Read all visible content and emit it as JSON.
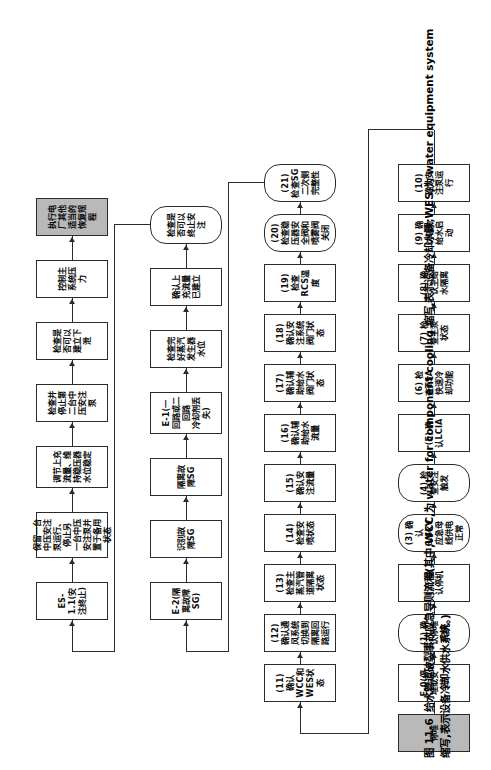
{
  "figure": {
    "number": "图 11-6",
    "caption": "给水管道破裂事故应急导则流程(其中,WCC,为 water for component cooling 缩写,表示设备冷却水源;WES,为 water equipment system 缩写,表示设备冷却水供水系统。)"
  },
  "colors": {
    "shaded_fill": "#b9b9b9",
    "node_border": "#2b2b2b",
    "page_background": "#ffffff"
  },
  "flow": {
    "row1": [
      {
        "id": "start",
        "label": "停堆",
        "shape": "rect",
        "shaded": true
      },
      {
        "id": "e0",
        "label": "E-0(停堆或安注)",
        "shape": "rect",
        "shaded": false
      },
      {
        "id": "s1",
        "label": "(1) 确认停堆完成",
        "shape": "rounded",
        "shaded": false
      },
      {
        "id": "s2",
        "label": "(2) 确认停机",
        "shape": "rect",
        "shaded": false
      },
      {
        "id": "s3",
        "label": "(3) 确认6.6kV应急母线供电正常",
        "shape": "rounded",
        "shaded": false
      },
      {
        "id": "s4",
        "label": "(4) 检查安注触发",
        "shape": "rounded",
        "shaded": false
      },
      {
        "id": "s5",
        "label": "(5) 确认LCIA",
        "shape": "rect",
        "shaded": false
      },
      {
        "id": "s6",
        "label": "(6) 检查TSA快速冷却功能",
        "shape": "rect",
        "shaded": false
      },
      {
        "id": "s7",
        "label": "(7) 检查主泵状态",
        "shape": "rect",
        "shaded": false
      },
      {
        "id": "s8",
        "label": "(8) 确认主给水隔离",
        "shape": "rect",
        "shaded": false
      },
      {
        "id": "s9",
        "label": "(9) 确认辅助给水启动",
        "shape": "rect",
        "shaded": false
      },
      {
        "id": "s10",
        "label": "(10) 确认安注泵运行",
        "shape": "rect",
        "shaded": false
      }
    ],
    "row2": [
      {
        "id": "s11",
        "label": "(11) 确认WCC和WES状态",
        "shape": "rect",
        "shaded": false
      },
      {
        "id": "s12",
        "label": "(12) 确认通风系统切换到隔离回路运行",
        "shape": "rect",
        "shaded": false
      },
      {
        "id": "s13",
        "label": "(13) 检查主蒸汽管道隔离状态",
        "shape": "rect",
        "shaded": false
      },
      {
        "id": "s14",
        "label": "(14) 检查安喷状态",
        "shape": "rect",
        "shaded": false
      },
      {
        "id": "s15",
        "label": "(15) 确认安注流量",
        "shape": "rect",
        "shaded": false
      },
      {
        "id": "s16",
        "label": "(16) 确认辅助给水流量",
        "shape": "rect",
        "shaded": false
      },
      {
        "id": "s17",
        "label": "(17) 确认辅助给水阀门状态",
        "shape": "rect",
        "shaded": false
      },
      {
        "id": "s18",
        "label": "(18) 确认安注系统阀门状态",
        "shape": "rect",
        "shaded": false
      },
      {
        "id": "s19",
        "label": "(19) 检查RCS温度",
        "shape": "rect",
        "shaded": false
      },
      {
        "id": "s20",
        "label": "(20) 检查稳压器安全阀和喷雾阀关闭",
        "shape": "rounded",
        "shaded": false
      },
      {
        "id": "s21",
        "label": "(21) 检查SG二次侧完整性",
        "shape": "rounded",
        "shaded": false
      }
    ],
    "row3": [
      {
        "id": "e2",
        "label": "E-2(隔离故障SG)",
        "shape": "rect",
        "shaded": false
      },
      {
        "id": "r3b",
        "label": "识别故障SG",
        "shape": "rect",
        "shaded": false
      },
      {
        "id": "r3c",
        "label": "隔离故障SG",
        "shape": "rect",
        "shaded": false
      },
      {
        "id": "e1",
        "label": "E-1(一回路或二回路\n冷却剂丢失)",
        "shape": "rect",
        "shaded": false
      },
      {
        "id": "r3e",
        "label": "检查完好蒸汽发生器水位",
        "shape": "rect",
        "shaded": false
      },
      {
        "id": "r3f",
        "label": "确认上充流量已建立",
        "shape": "rect",
        "shaded": false
      },
      {
        "id": "r3g",
        "label": "检查是否可以终止安注",
        "shape": "rounded",
        "shaded": false
      }
    ],
    "row4": [
      {
        "id": "es11",
        "label": "ES-1.1(安注终止)",
        "shape": "rect",
        "shaded": false
      },
      {
        "id": "r4b",
        "label": "保留一台中压安注泵运行、停止另\n一台中压安注泵并置于备用状态",
        "shape": "rect",
        "shaded": false
      },
      {
        "id": "r4c",
        "label": "调节上充流量、维持稳压器\n水位稳定",
        "shape": "rect",
        "shaded": false
      },
      {
        "id": "r4d",
        "label": "检查并停止第二台中压安注泵",
        "shape": "rect",
        "shaded": false
      },
      {
        "id": "r4e",
        "label": "检查是否可以建立下泄",
        "shape": "rect",
        "shaded": false
      },
      {
        "id": "r4f",
        "label": "控制主系统压力",
        "shape": "rect",
        "shaded": false
      },
      {
        "id": "r4g",
        "label": "执行电厂其他适当的恢复规程",
        "shape": "rect",
        "shaded": true
      }
    ]
  }
}
